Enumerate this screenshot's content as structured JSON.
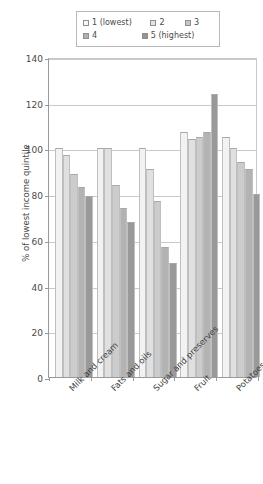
{
  "chart_data": {
    "type": "bar",
    "title": "",
    "xlabel": "",
    "ylabel": "% of lowest income quintile",
    "ylim": [
      0,
      140
    ],
    "yticks": [
      0,
      20,
      40,
      60,
      80,
      100,
      120,
      140
    ],
    "grid": true,
    "legend_position": "top",
    "categories": [
      "Milk and cream",
      "Fats and oils",
      "Sugar and preserves",
      "Fruit",
      "Potatoes"
    ],
    "series": [
      {
        "name": "1 (lowest)",
        "color": "#f2f2f2",
        "values": [
          100,
          100,
          100,
          107,
          105
        ]
      },
      {
        "name": "2",
        "color": "#e0e0e0",
        "values": [
          97,
          100,
          91,
          104,
          100
        ]
      },
      {
        "name": "3",
        "color": "#cccccc",
        "values": [
          89,
          84,
          77,
          105,
          94
        ]
      },
      {
        "name": "4",
        "color": "#b3b3b3",
        "values": [
          83,
          74,
          57,
          107,
          91
        ]
      },
      {
        "name": "5 (highest)",
        "color": "#999999",
        "values": [
          79,
          68,
          50,
          124,
          80
        ]
      }
    ]
  },
  "legend": {
    "items": [
      {
        "label": "1 (lowest)"
      },
      {
        "label": "2"
      },
      {
        "label": "3"
      },
      {
        "label": "4"
      },
      {
        "label": "5 (highest)"
      }
    ]
  },
  "axis": {
    "y_title": "% of lowest income quintile",
    "y_tick_labels": [
      "140",
      "120",
      "100",
      "80",
      "60",
      "40",
      "20",
      "0"
    ]
  }
}
